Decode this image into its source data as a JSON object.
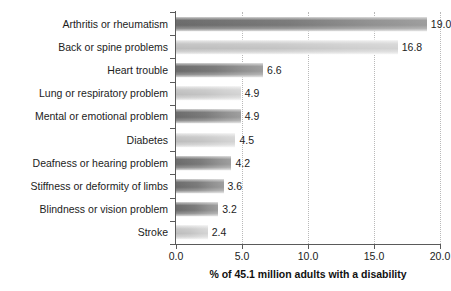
{
  "chart_data": {
    "type": "bar",
    "orientation": "horizontal",
    "title": "",
    "xlabel": "% of 45.1 million adults with a disability",
    "ylabel": "",
    "xlim": [
      0.0,
      20.0
    ],
    "xticks": [
      "0.0",
      "5.0",
      "10.0",
      "15.0",
      "20.0"
    ],
    "xtick_values": [
      0.0,
      5.0,
      10.0,
      15.0,
      20.0
    ],
    "grid": "vertical-dotted",
    "legend": "none",
    "categories": [
      "Arthritis or rheumatism",
      "Back or spine problems",
      "Heart trouble",
      "Lung or respiratory problem",
      "Mental or emotional problem",
      "Diabetes",
      "Deafness or hearing problem",
      "Stiffness or deformity of limbs",
      "Blindness or vision problem",
      "Stroke"
    ],
    "values": [
      19.0,
      16.8,
      6.6,
      4.9,
      4.9,
      4.5,
      4.2,
      3.6,
      3.2,
      2.4
    ],
    "value_labels": [
      "19.0",
      "16.8",
      "6.6",
      "4.9",
      "4.9",
      "4.5",
      "4.2",
      "3.6",
      "3.2",
      "2.4"
    ],
    "bar_shades": [
      "dark",
      "light",
      "dark",
      "light",
      "dark",
      "light",
      "dark",
      "dark",
      "dark",
      "light"
    ],
    "colors": {
      "bar_dark": "#6e6e6e",
      "bar_light": "#c6c6c6",
      "axis": "#5a5a5a",
      "gridline": "#b9b9b9",
      "text": "#1c1c1c",
      "background": "#ffffff"
    }
  }
}
